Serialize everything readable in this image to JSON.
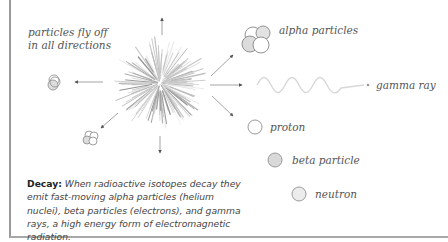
{
  "labels": {
    "particles_fly_off": [
      "particles fly off",
      "in all directions"
    ],
    "alpha": "alpha particles",
    "gamma": "gamma ray",
    "proton": "proton",
    "beta": "beta particle",
    "neutron": "neutron"
  },
  "caption": {
    "term": "Decay:",
    "text": " When radioactive isotopes decay they emit fast-moving alpha particles (helium nuclei), beta particles (electrons), and gamma rays, a high energy form of electromagnetic radiation."
  },
  "legend": [
    {
      "name": "proton",
      "fill": "#ffffff",
      "stroke": "#9a9a9a"
    },
    {
      "name": "beta particle",
      "fill": "#d9d9d9",
      "stroke": "#9a9a9a"
    },
    {
      "name": "neutron",
      "fill": "#ececec",
      "stroke": "#9a9a9a"
    }
  ],
  "colors": {
    "line": "#888888",
    "text": "#555555",
    "border": "#9a9a9a"
  }
}
